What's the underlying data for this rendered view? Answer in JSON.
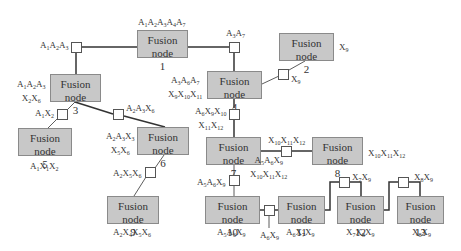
{
  "diagram": {
    "node_title": "Fusion node",
    "nodes": [
      {
        "id": "1",
        "label": "Fusion node",
        "number": "1",
        "variables": "A1A2A3A4A7"
      },
      {
        "id": "2",
        "label": "Fusion node",
        "number": "2",
        "variables": "X9"
      },
      {
        "id": "3",
        "label": "Fusion node",
        "number": "3",
        "variables": "A1A2A3X2X6"
      },
      {
        "id": "4",
        "label": "Fusion node",
        "number": "4",
        "variables": "A3A6A7X9X10X11"
      },
      {
        "id": "5",
        "label": "Fusion node",
        "number": "5",
        "variables": "A1X1X2"
      },
      {
        "id": "6",
        "label": "Fusion node",
        "number": "6",
        "variables": "A2A3X5X6"
      },
      {
        "id": "7",
        "label": "Fusion node",
        "number": "7",
        "variables": "A5A6X9X10X11X12"
      },
      {
        "id": "8",
        "label": "Fusion node",
        "number": "8",
        "variables": "X10X11X12"
      },
      {
        "id": "9",
        "label": "Fusion node",
        "number": "9",
        "variables": "A2X4X5X6"
      },
      {
        "id": "10",
        "label": "Fusion node",
        "number": "10",
        "variables": "A5A6X9"
      },
      {
        "id": "11",
        "label": "Fusion node",
        "number": "11",
        "variables": "A6X7X9"
      },
      {
        "id": "12",
        "label": "Fusion node",
        "number": "12",
        "variables": "X7X8X9"
      },
      {
        "id": "13",
        "label": "Fusion node",
        "number": "13",
        "variables": "X8X9"
      }
    ],
    "separators": [
      {
        "between": [
          "1",
          "3"
        ],
        "label": "A1A2A3"
      },
      {
        "between": [
          "1",
          "4"
        ],
        "label": "A3A7"
      },
      {
        "between": [
          "4",
          "2"
        ],
        "label": "X9"
      },
      {
        "between": [
          "3",
          "5"
        ],
        "label": "A1X2"
      },
      {
        "between": [
          "3",
          "6"
        ],
        "label": "A2A3X6"
      },
      {
        "between": [
          "4",
          "7"
        ],
        "label": "A6X9X10X11X12"
      },
      {
        "between": [
          "6",
          "9"
        ],
        "label": "A2X5X6"
      },
      {
        "between": [
          "7",
          "8"
        ],
        "label": "X10X11X12"
      },
      {
        "between": [
          "7",
          "10"
        ],
        "label": "A5A6X9"
      },
      {
        "between": [
          "10",
          "11"
        ],
        "label": "A6X9"
      },
      {
        "between": [
          "11",
          "12"
        ],
        "label": "X7X9"
      },
      {
        "between": [
          "12",
          "13"
        ],
        "label": "X8X9"
      }
    ]
  },
  "colors": {
    "node_fill": "#c8c8c8",
    "node_border": "#8a8a8a",
    "line": "#333333",
    "separator_fill": "#ffffff"
  }
}
